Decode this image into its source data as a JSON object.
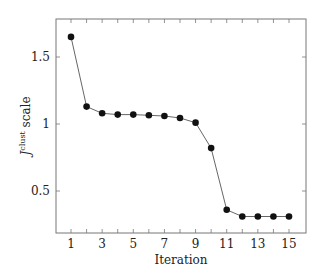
{
  "chart_data": {
    "type": "line",
    "title": "",
    "xlabel": "Iteration",
    "ylabel": "J^clust scale",
    "ylabel_main": "J",
    "ylabel_sup": "clust",
    "ylabel_rest": " scale",
    "x": [
      1,
      2,
      3,
      4,
      5,
      6,
      7,
      8,
      9,
      10,
      11,
      12,
      13,
      14,
      15
    ],
    "series": [
      {
        "name": "J^clust",
        "values": [
          1.65,
          1.13,
          1.08,
          1.07,
          1.07,
          1.065,
          1.06,
          1.045,
          1.01,
          0.82,
          0.36,
          0.31,
          0.31,
          0.31,
          0.31
        ]
      }
    ],
    "xticks": [
      "1",
      "3",
      "5",
      "7",
      "9",
      "11",
      "13",
      "15"
    ],
    "yticks": [
      "0.5",
      "1",
      "1.5"
    ],
    "xlim": [
      0.3,
      16
    ],
    "ylim": [
      0.18,
      1.78
    ],
    "grid": false,
    "legend": "none",
    "marker": "circle",
    "line_color": "#555555",
    "marker_color": "#111111"
  }
}
